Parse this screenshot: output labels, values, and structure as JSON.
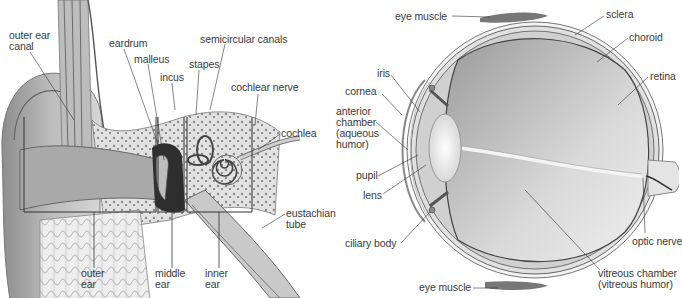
{
  "figure": {
    "ear_diagram": {
      "name": "ear-cross-section",
      "labels": [
        {
          "id": "outer-ear-canal",
          "text": "outer ear\ncanal",
          "x": 9,
          "y": 30
        },
        {
          "id": "eardrum",
          "text": "eardrum",
          "x": 109,
          "y": 38
        },
        {
          "id": "malleus",
          "text": "malleus",
          "x": 134,
          "y": 54
        },
        {
          "id": "incus",
          "text": "incus",
          "x": 160,
          "y": 72
        },
        {
          "id": "semicircular-canals",
          "text": "semicircular canals",
          "x": 200,
          "y": 34
        },
        {
          "id": "stapes",
          "text": "stapes",
          "x": 189,
          "y": 59
        },
        {
          "id": "cochlear-nerve",
          "text": "cochlear nerve",
          "x": 231,
          "y": 82
        },
        {
          "id": "cochlea",
          "text": "cochlea",
          "x": 281,
          "y": 128
        },
        {
          "id": "eustachian-tube",
          "text": "eustachian\ntube",
          "x": 286,
          "y": 208
        },
        {
          "id": "outer-ear",
          "text": "outer\near",
          "x": 81,
          "y": 268
        },
        {
          "id": "middle-ear",
          "text": "middle\near",
          "x": 155,
          "y": 268
        },
        {
          "id": "inner-ear",
          "text": "inner\near",
          "x": 205,
          "y": 268
        }
      ]
    },
    "eye_diagram": {
      "name": "eye-cross-section",
      "labels": [
        {
          "id": "eye-muscle-top",
          "text": "eye muscle",
          "x": 395,
          "y": 11
        },
        {
          "id": "sclera",
          "text": "sclera",
          "x": 606,
          "y": 9
        },
        {
          "id": "choroid",
          "text": "choroid",
          "x": 629,
          "y": 32
        },
        {
          "id": "iris",
          "text": "iris",
          "x": 377,
          "y": 68
        },
        {
          "id": "retina",
          "text": "retina",
          "x": 650,
          "y": 71
        },
        {
          "id": "cornea",
          "text": "cornea",
          "x": 345,
          "y": 86
        },
        {
          "id": "anterior-chamber",
          "text": "anterior\nchamber\n(aqueous\nhumor)",
          "x": 336,
          "y": 106
        },
        {
          "id": "pupil",
          "text": "pupil",
          "x": 356,
          "y": 170
        },
        {
          "id": "lens",
          "text": "lens",
          "x": 363,
          "y": 190
        },
        {
          "id": "ciliary-body",
          "text": "ciliary body",
          "x": 345,
          "y": 238
        },
        {
          "id": "optic-nerve",
          "text": "optic nerve",
          "x": 632,
          "y": 236
        },
        {
          "id": "vitreous-chamber",
          "text": "vitreous chamber\n(vitreous humor)",
          "x": 598,
          "y": 268
        },
        {
          "id": "eye-muscle-bottom",
          "text": "eye muscle",
          "x": 419,
          "y": 282
        }
      ]
    }
  }
}
